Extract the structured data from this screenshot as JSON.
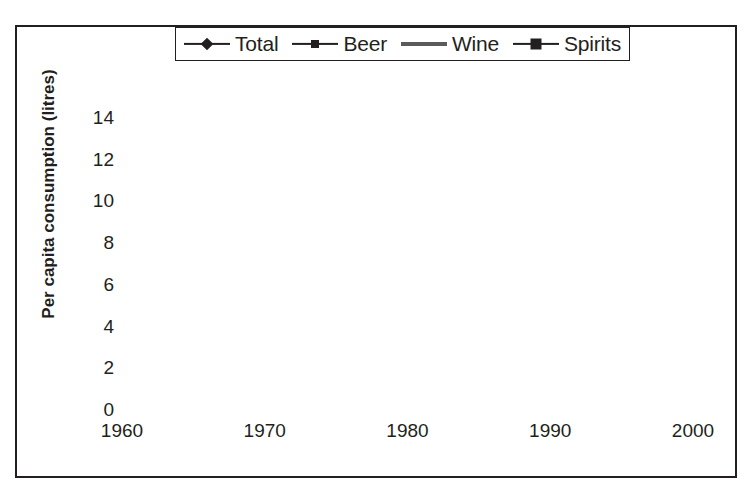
{
  "chart_data": {
    "type": "line",
    "title": "",
    "xlabel": "",
    "ylabel": "Per capita consumption (litres)",
    "xlim": [
      1960,
      2000
    ],
    "ylim": [
      0,
      14
    ],
    "xticks": [
      1960,
      1970,
      1980,
      1990,
      2000
    ],
    "yticks": [
      0,
      2,
      4,
      6,
      8,
      10,
      12,
      14
    ],
    "grid": "horizontal",
    "legend_position": "top",
    "x": [
      1961,
      1962,
      1963,
      1964,
      1965,
      1966,
      1967,
      1968,
      1969,
      1970,
      1971,
      1972,
      1973,
      1974,
      1975,
      1976,
      1977,
      1978,
      1979,
      1980,
      1981,
      1982,
      1983,
      1984,
      1985,
      1986,
      1987,
      1988,
      1989,
      1990,
      1991,
      1992,
      1993,
      1994,
      1995,
      1996,
      1997,
      1998,
      1999
    ],
    "series": [
      {
        "name": "Total",
        "marker": "diamond",
        "color": "#231f20",
        "values": [
          8.65,
          8.8,
          8.85,
          9.1,
          9.3,
          9.45,
          9.85,
          9.5,
          10.2,
          10.7,
          11.3,
          11.6,
          12.2,
          12.35,
          12.4,
          12.4,
          12.5,
          13.0,
          12.45,
          12.6,
          12.4,
          12.65,
          11.85,
          12.0,
          12.05,
          12.15,
          11.5,
          11.35,
          11.2,
          11.15,
          10.7,
          10.6,
          10.35,
          10.15,
          9.95,
          9.85,
          9.4,
          9.65,
          9.9
        ]
      },
      {
        "name": "Beer",
        "marker": "square-small",
        "color": "#231f20",
        "values": [
          6.75,
          6.8,
          6.75,
          6.95,
          7.0,
          7.05,
          7.2,
          7.25,
          7.4,
          7.5,
          7.7,
          7.95,
          8.2,
          8.1,
          8.05,
          7.95,
          7.55,
          7.9,
          7.35,
          7.4,
          7.35,
          7.35,
          7.05,
          7.2,
          7.2,
          7.3,
          7.0,
          6.9,
          6.65,
          6.5,
          6.1,
          6.05,
          6.05,
          5.9,
          5.55,
          5.1,
          5.05,
          5.05,
          5.05
        ]
      },
      {
        "name": "Wine",
        "marker": "none",
        "color": "#6b6b6b",
        "values": [
          0.42,
          0.45,
          0.5,
          0.55,
          0.6,
          0.68,
          0.72,
          0.82,
          0.95,
          1.05,
          1.25,
          1.45,
          1.65,
          1.85,
          2.0,
          2.1,
          2.15,
          2.3,
          2.4,
          2.55,
          2.5,
          2.65,
          2.6,
          2.7,
          2.75,
          3.15,
          2.85,
          2.9,
          2.85,
          3.0,
          3.05,
          2.95,
          3.0,
          3.0,
          3.05,
          3.1,
          3.15,
          3.1,
          3.05
        ]
      },
      {
        "name": "Spirits",
        "marker": "square-large",
        "color": "#231f20",
        "values": [
          1.55,
          1.5,
          1.55,
          1.85,
          1.8,
          1.75,
          1.8,
          1.45,
          1.55,
          1.75,
          1.95,
          2.15,
          2.3,
          2.45,
          2.65,
          2.9,
          2.85,
          2.8,
          2.55,
          2.7,
          2.5,
          2.7,
          2.4,
          2.35,
          2.2,
          2.05,
          1.8,
          1.9,
          1.85,
          1.8,
          1.7,
          1.65,
          1.6,
          1.55,
          1.5,
          1.45,
          1.55,
          1.9,
          1.95
        ]
      }
    ]
  },
  "legend": {
    "items": [
      {
        "label": "Total",
        "marker": "diamond"
      },
      {
        "label": "Beer",
        "marker": "square-small"
      },
      {
        "label": "Wine",
        "marker": "none"
      },
      {
        "label": "Spirits",
        "marker": "square-large"
      }
    ]
  },
  "axes": {
    "y_title": "Per capita consumption (litres)",
    "y_tick_labels": [
      "14",
      "12",
      "10",
      "8",
      "6",
      "4",
      "2",
      "0"
    ],
    "x_tick_labels": [
      "1960",
      "1970",
      "1980",
      "1990",
      "2000"
    ]
  }
}
